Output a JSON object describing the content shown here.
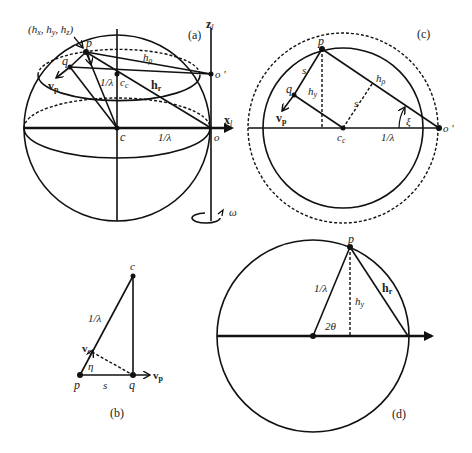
{
  "figure": {
    "panels": [
      {
        "id": "a",
        "label": "(a)",
        "description": "Ewald sphere with rotation axis",
        "labels": {
          "h_coords": "(hₓ, hᵧ, h₂)",
          "h_coords_text": "(hx, hy, hz)",
          "p": "p",
          "q": "q",
          "vp": "v",
          "vp_sub": "p",
          "h_rho": "h",
          "h_rho_sub": "ρ",
          "inv_lambda_vertical": "1/λ",
          "cc": "c",
          "cc_sub": "c",
          "hr": "h",
          "hr_sub": "r",
          "c": "c",
          "inv_lambda_axis": "1/λ",
          "o": "o",
          "o_prime": "o '",
          "x_axis": "x",
          "x_axis_sub": "l",
          "z_axis": "z",
          "z_axis_sub": "l",
          "omega": "ω"
        }
      },
      {
        "id": "b",
        "label": "(b)",
        "description": "Velocity triangle",
        "labels": {
          "c": "c",
          "inv_lambda": "1/λ",
          "vc": "v",
          "vc_sub": "c",
          "eta": "η",
          "p": "p",
          "s": "s",
          "q": "q",
          "vp": "v",
          "vp_sub": "p"
        }
      },
      {
        "id": "c",
        "label": "(c)",
        "description": "Cross-section circle at height hz",
        "labels": {
          "p": "p",
          "s_upper": "s",
          "q": "q",
          "hy": "h",
          "hy_sub": "y",
          "vp": "v",
          "vp_sub": "p",
          "cc": "c",
          "cc_sub": "c",
          "s_dashed": "s",
          "h_rho": "h",
          "h_rho_sub": "ρ",
          "xi": "ξ",
          "inv_lambda": "1/λ",
          "o_prime": "o '"
        }
      },
      {
        "id": "d",
        "label": "(d)",
        "description": "Scattering angle geometry",
        "labels": {
          "p": "p",
          "inv_lambda": "1/λ",
          "hy": "h",
          "hy_sub": "y",
          "hr": "h",
          "hr_sub": "r",
          "two_theta": "2θ"
        }
      }
    ],
    "colors": {
      "line": "#111111",
      "text": "#222222",
      "background": "#ffffff"
    }
  }
}
